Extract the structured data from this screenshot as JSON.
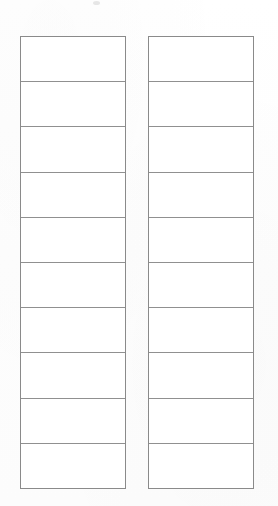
{
  "document": {
    "kind": "scanned-blank-form",
    "background_color": "#ffffff",
    "border_color": "#8a8a8a",
    "rule_color": "#909090",
    "page_width": 278,
    "page_height": 506
  },
  "tables": [
    {
      "name": "left-table",
      "columns": 1,
      "row_count": 10,
      "rows": [
        {
          "cells": [
            ""
          ]
        },
        {
          "cells": [
            ""
          ]
        },
        {
          "cells": [
            ""
          ]
        },
        {
          "cells": [
            ""
          ]
        },
        {
          "cells": [
            ""
          ]
        },
        {
          "cells": [
            ""
          ]
        },
        {
          "cells": [
            ""
          ]
        },
        {
          "cells": [
            ""
          ]
        },
        {
          "cells": [
            ""
          ]
        },
        {
          "cells": [
            ""
          ]
        }
      ]
    },
    {
      "name": "right-table",
      "columns": 1,
      "row_count": 10,
      "rows": [
        {
          "cells": [
            ""
          ]
        },
        {
          "cells": [
            ""
          ]
        },
        {
          "cells": [
            ""
          ]
        },
        {
          "cells": [
            ""
          ]
        },
        {
          "cells": [
            ""
          ]
        },
        {
          "cells": [
            ""
          ]
        },
        {
          "cells": [
            ""
          ]
        },
        {
          "cells": [
            ""
          ]
        },
        {
          "cells": [
            ""
          ]
        },
        {
          "cells": [
            ""
          ]
        }
      ]
    }
  ],
  "marks": [
    {
      "name": "top-smudge",
      "x": 93,
      "y": 1,
      "width": 7,
      "height": 4
    }
  ]
}
